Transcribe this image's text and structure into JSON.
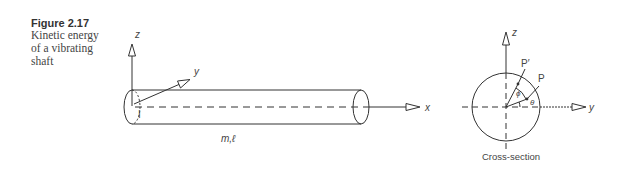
{
  "caption": {
    "figure_number": "Figure 2.17",
    "title_lines": [
      "Kinetic energy",
      "of a vibrating",
      "shaft"
    ]
  },
  "shaft_view": {
    "axis_z_label": "z",
    "axis_y_label": "y",
    "axis_x_label": "x",
    "origin_label": "I",
    "mass_length_label": "m,ℓ"
  },
  "cross_section": {
    "axis_z_label": "z",
    "axis_y_label": "y",
    "point_p_label": "P",
    "point_p_prime_label": "P′",
    "angle_phi_label": "ϕ",
    "angle_theta_label": "θ",
    "caption": "Cross-section"
  }
}
